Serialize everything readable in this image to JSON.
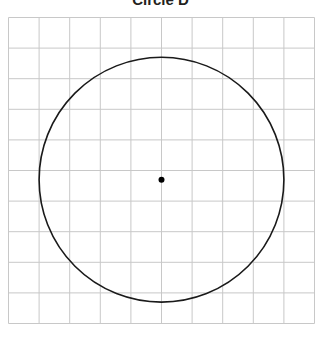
{
  "title": "Circle D",
  "grid": {
    "left": 8.5,
    "top": 17.5,
    "cell": 30.6,
    "cols": 10,
    "rows": 10,
    "line_color": "#c8c8c8"
  },
  "circle": {
    "center_col": 5,
    "center_row": 5.3,
    "radius_cells": 4,
    "stroke": "#1a1a1a"
  },
  "center_point": {
    "label": "",
    "color": "#000000"
  }
}
